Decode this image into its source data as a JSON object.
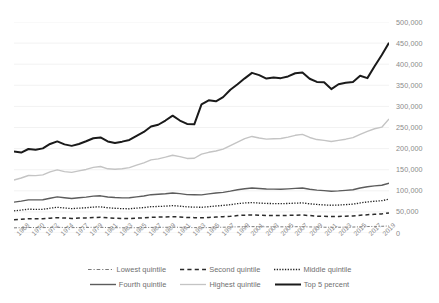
{
  "chart_data": {
    "type": "line",
    "title": "",
    "subtitle": "",
    "xlabel": "",
    "ylabel": "",
    "ylim": [
      0,
      500000
    ],
    "xlim": [
      1967,
      2019
    ],
    "grid": true,
    "grid_axis": "y",
    "legend_position": "bottom",
    "y_ticks": [
      0,
      50000,
      100000,
      150000,
      200000,
      250000,
      300000,
      350000,
      400000,
      450000,
      500000
    ],
    "y_tick_labels": [
      "0",
      "50,000",
      "100,000",
      "150,000",
      "200,000",
      "250,000",
      "300,000",
      "350,000",
      "400,000",
      "450,000",
      "500,000"
    ],
    "x_tick_labels": [
      "1968",
      "1970",
      "1972",
      "1974",
      "1977",
      "1979",
      "1981",
      "1983",
      "1985",
      "1987",
      "1989",
      "1991",
      "1993",
      "1995",
      "1997",
      "1999",
      "2001",
      "2003",
      "2005",
      "2007",
      "2009",
      "2011",
      "2013",
      "2015",
      "2017",
      "2019"
    ],
    "x": [
      1967,
      1968,
      1969,
      1970,
      1971,
      1972,
      1973,
      1974,
      1975,
      1976,
      1977,
      1978,
      1979,
      1980,
      1981,
      1982,
      1983,
      1984,
      1985,
      1986,
      1987,
      1988,
      1989,
      1990,
      1991,
      1992,
      1993,
      1994,
      1995,
      1996,
      1997,
      1998,
      1999,
      2000,
      2001,
      2002,
      2003,
      2004,
      2005,
      2006,
      2007,
      2008,
      2009,
      2010,
      2011,
      2012,
      2013,
      2014,
      2015,
      2016,
      2017,
      2018,
      2019
    ],
    "series": [
      {
        "name": "Lowest quintile",
        "style": "dash-dot",
        "color": "#7a7a7a",
        "width": 1.0,
        "values": [
          12200,
          12600,
          13100,
          12900,
          12700,
          13200,
          13500,
          13100,
          12700,
          13000,
          13100,
          13500,
          13500,
          12900,
          12600,
          12400,
          12300,
          12600,
          12800,
          13200,
          13400,
          13500,
          13800,
          13500,
          12900,
          12800,
          12500,
          12900,
          13500,
          13700,
          14100,
          14600,
          15000,
          15100,
          14900,
          14700,
          14600,
          14600,
          14700,
          14900,
          15000,
          14400,
          14000,
          13700,
          13500,
          13600,
          13900,
          14100,
          14700,
          15300,
          15600,
          15900,
          16700
        ]
      },
      {
        "name": "Second quintile",
        "style": "dashed",
        "color": "#2b2b2b",
        "width": 1.5,
        "values": [
          31600,
          32600,
          34000,
          33700,
          33500,
          35100,
          36400,
          35500,
          34500,
          35300,
          35800,
          36800,
          37200,
          35900,
          35100,
          34500,
          34300,
          35300,
          36000,
          37300,
          37700,
          38200,
          38700,
          38100,
          36800,
          36400,
          35900,
          36700,
          37900,
          38600,
          39700,
          41200,
          42300,
          42800,
          42300,
          41600,
          41500,
          41400,
          41700,
          42200,
          42600,
          41300,
          40000,
          39400,
          38900,
          39200,
          39800,
          40400,
          42000,
          43300,
          44400,
          45300,
          47400
        ]
      },
      {
        "name": "Middle quintile",
        "style": "dotted",
        "color": "#222222",
        "width": 1.3,
        "values": [
          52500,
          54300,
          56400,
          56100,
          56100,
          58800,
          61000,
          59300,
          57700,
          58900,
          59800,
          61500,
          62000,
          59800,
          58600,
          57700,
          57400,
          59000,
          60200,
          62400,
          62900,
          63700,
          64800,
          63700,
          61900,
          61400,
          60900,
          62300,
          64000,
          65300,
          67100,
          69600,
          71200,
          72000,
          71000,
          70000,
          69800,
          69500,
          70000,
          70700,
          71300,
          69200,
          67600,
          66500,
          65700,
          66300,
          67300,
          68300,
          71300,
          73600,
          75300,
          76600,
          80000
        ]
      },
      {
        "name": "Fourth quintile",
        "style": "solid",
        "color": "#5c5c5c",
        "width": 1.4,
        "values": [
          73100,
          75600,
          78500,
          78400,
          78900,
          82500,
          85500,
          83600,
          81900,
          83700,
          85100,
          87300,
          88100,
          85300,
          84000,
          83300,
          83400,
          85700,
          87700,
          90800,
          91800,
          93000,
          94700,
          93200,
          90900,
          90500,
          90300,
          92600,
          94800,
          96300,
          99100,
          102600,
          105000,
          106600,
          105500,
          104200,
          104000,
          103600,
          104500,
          105700,
          106600,
          103800,
          101700,
          100300,
          99100,
          99900,
          101100,
          102600,
          106600,
          109600,
          111600,
          113200,
          118000
        ]
      },
      {
        "name": "Highest quintile",
        "style": "solid",
        "color": "#c4c4c4",
        "width": 1.4,
        "values": [
          125600,
          130400,
          136200,
          135900,
          137700,
          144800,
          149600,
          145500,
          143600,
          147100,
          150600,
          155600,
          157500,
          152100,
          150900,
          152400,
          154900,
          160700,
          166300,
          173300,
          175700,
          179700,
          184200,
          181000,
          176700,
          177100,
          186800,
          191200,
          194300,
          198700,
          207300,
          215600,
          223500,
          228800,
          225000,
          222400,
          223300,
          223800,
          227200,
          231500,
          233800,
          226400,
          221400,
          219600,
          216700,
          219500,
          222300,
          226000,
          233800,
          241000,
          247000,
          250800,
          270000
        ]
      },
      {
        "name": "Top 5 percent",
        "style": "solid",
        "color": "#1a1a1a",
        "width": 2.0,
        "values": [
          193000,
          190500,
          199000,
          197500,
          200500,
          211000,
          217000,
          210000,
          206500,
          211000,
          217500,
          224500,
          226500,
          217000,
          213500,
          216500,
          220500,
          230000,
          239500,
          252500,
          256500,
          266500,
          278000,
          266500,
          258500,
          257500,
          305000,
          314500,
          312000,
          322000,
          339500,
          352500,
          366500,
          379500,
          374000,
          366000,
          368500,
          367000,
          371000,
          378500,
          380500,
          365500,
          358000,
          357000,
          341000,
          352500,
          356000,
          358000,
          372500,
          367000,
          395000,
          422000,
          451000
        ]
      }
    ]
  },
  "legend": {
    "items": [
      {
        "label": "Lowest quintile",
        "style": "dash-dot",
        "color": "#7a7a7a"
      },
      {
        "label": "Second quintile",
        "style": "dashed",
        "color": "#2b2b2b"
      },
      {
        "label": "Middle quintile",
        "style": "dotted",
        "color": "#222222"
      },
      {
        "label": "Fourth quintile",
        "style": "solid",
        "color": "#5c5c5c"
      },
      {
        "label": "Highest quintile",
        "style": "solid",
        "color": "#c4c4c4"
      },
      {
        "label": "Top 5 percent",
        "style": "solid",
        "color": "#1a1a1a"
      }
    ]
  },
  "style": {
    "gridline_color": "#ededed",
    "tick_text_color": "#8a8a8a",
    "background": "#ffffff"
  }
}
